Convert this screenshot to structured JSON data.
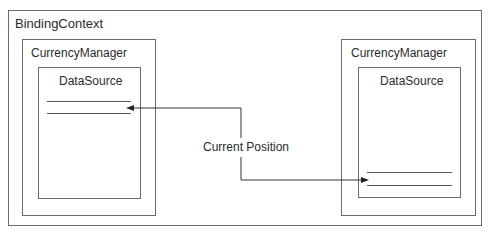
{
  "diagram": {
    "outer": {
      "label": "BindingContext"
    },
    "left_manager": {
      "label": "CurrencyManager",
      "datasource": {
        "label": "DataSource",
        "rows": 2
      }
    },
    "right_manager": {
      "label": "CurrencyManager",
      "datasource": {
        "label": "DataSource",
        "rows": 2
      }
    },
    "connector": {
      "label": "Current Position"
    }
  },
  "colors": {
    "border": "#6b6b6b",
    "line": "#555555",
    "text": "#2b2b2b",
    "background": "#ffffff"
  }
}
